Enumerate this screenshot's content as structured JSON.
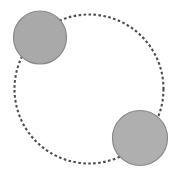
{
  "figure": {
    "canvas": {
      "width": 179,
      "height": 180,
      "background": "#ffffff"
    },
    "style": {
      "node_fill": "#a9a9a9",
      "node_stroke": "#8a8a8a",
      "node_stroke_width": 1.2,
      "path_stroke": "#4d4d4d",
      "path_stroke_width": 2.1,
      "path_dash": "2.6 2.4",
      "path_fill": "none"
    },
    "dashed_path": {
      "shape": "circle",
      "label": "dashed-circular-path",
      "cx": 89,
      "cy": 89,
      "r": 74.5
    },
    "nodes": [
      {
        "label": "upper-left-circle",
        "cx": 40,
        "cy": 37.5,
        "r": 26.5,
        "fill": "#a9a9a9",
        "stroke": "#8a8a8a"
      },
      {
        "label": "lower-right-circle",
        "cx": 140,
        "cy": 138,
        "r": 27.5,
        "fill": "#afafaf",
        "stroke": "#8a8a8a"
      }
    ]
  }
}
